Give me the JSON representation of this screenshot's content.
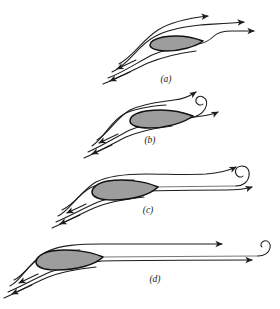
{
  "figure": {
    "title_visible": false,
    "background_color": "#ffffff",
    "stroke_color": "#1d1d1d",
    "airfoil_fill_color": "#9d9d9d",
    "airfoil_stroke_color": "#111111",
    "panel_count": 4
  },
  "panels": [
    {
      "id": "a",
      "label": "(a)",
      "label_x": 166,
      "label_y": 82,
      "description": "airfoil with smooth attached flow, streamlines closing behind trailing edge",
      "airfoil": {
        "leading_edge_x": 152,
        "leading_edge_y": 44,
        "trailing_edge_x": 203,
        "trailing_edge_y": 41,
        "chord": 52,
        "thickness": 11,
        "angle_deg": -6
      },
      "vortex": {
        "present": false
      },
      "streamline_count": 4,
      "arrow_count": 5
    },
    {
      "id": "b",
      "label": "(b)",
      "label_x": 150,
      "label_y": 143,
      "description": "starting vortex forming immediately behind the trailing edge, small tight spiral",
      "airfoil": {
        "leading_edge_x": 128,
        "leading_edge_y": 121,
        "trailing_edge_x": 188,
        "trailing_edge_y": 116,
        "chord": 61,
        "thickness": 12,
        "angle_deg": -6
      },
      "vortex": {
        "present": true,
        "center_x": 205,
        "center_y": 108,
        "radius": 8,
        "turns": 1.6,
        "sense": "counterclockwise"
      },
      "streamline_count": 4,
      "arrow_count": 5
    },
    {
      "id": "c",
      "label": "(c)",
      "label_x": 148,
      "label_y": 213,
      "description": "starting vortex shed and convected downstream, larger spiral further from the airfoil",
      "airfoil": {
        "leading_edge_x": 96,
        "leading_edge_y": 192,
        "trailing_edge_x": 152,
        "trailing_edge_y": 187,
        "chord": 57,
        "thickness": 13,
        "angle_deg": -6
      },
      "vortex": {
        "present": true,
        "center_x": 238,
        "center_y": 180,
        "radius": 9,
        "turns": 1.7,
        "sense": "counterclockwise"
      },
      "streamline_count": 4,
      "arrow_count": 5
    },
    {
      "id": "d",
      "label": "(d)",
      "label_x": 155,
      "label_y": 282,
      "description": "starting vortex far downstream, steady circulation established about the airfoil",
      "airfoil": {
        "leading_edge_x": 40,
        "leading_edge_y": 262,
        "trailing_edge_x": 96,
        "trailing_edge_y": 256,
        "chord": 57,
        "thickness": 13,
        "angle_deg": -6
      },
      "vortex": {
        "present": true,
        "center_x": 266,
        "center_y": 247,
        "radius": 6,
        "turns": 1.5,
        "sense": "counterclockwise"
      },
      "streamline_count": 4,
      "arrow_count": 5
    }
  ]
}
